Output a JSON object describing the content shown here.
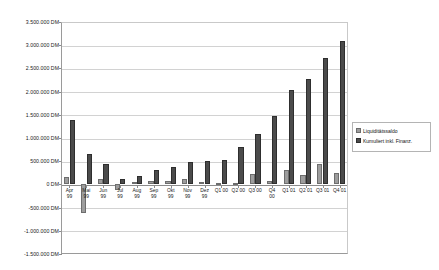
{
  "chart_data": {
    "type": "bar",
    "title": "",
    "xlabel": "",
    "ylabel": "",
    "ylim": [
      -1500000,
      3500000
    ],
    "ytick_step": 500000,
    "grid": true,
    "legend_position": "right",
    "unit": "DM",
    "ytick_labels": [
      "3.500.000 DM",
      "3.000.000 DM",
      "2.500.000 DM",
      "2.000.000 DM",
      "1.500.000 DM",
      "1.000.000 DM",
      "500.000 DM",
      "0 DM",
      "-500.000 DM",
      "-1.000.000 DM",
      "-1.500.000 DM"
    ],
    "ytick_values": [
      3500000,
      3000000,
      2500000,
      2000000,
      1500000,
      1000000,
      500000,
      0,
      -500000,
      -1000000,
      -1500000
    ],
    "categories": [
      "Apr 99",
      "Mai 99",
      "Jun 99",
      "Jul 99",
      "Aug 99",
      "Sep 99",
      "Okt 99",
      "Nov 99",
      "Dez 99",
      "Q1 00",
      "Q2 00",
      "Q3 00",
      "Q4 00",
      "Q1 01",
      "Q2 01",
      "Q3 01",
      "Q4 01"
    ],
    "category_lines": [
      [
        "Apr",
        "99"
      ],
      [
        "Mai",
        "99"
      ],
      [
        "Jun",
        "99"
      ],
      [
        "Jul",
        "99"
      ],
      [
        "Aug",
        "99"
      ],
      [
        "Sep",
        "99"
      ],
      [
        "Okt",
        "99"
      ],
      [
        "Nov",
        "99"
      ],
      [
        "Dez",
        "99"
      ],
      [
        "Q1 00",
        ""
      ],
      [
        "Q2 00",
        ""
      ],
      [
        "Q3 00",
        ""
      ],
      [
        "Q4",
        "00"
      ],
      [
        "Q1 01",
        ""
      ],
      [
        "Q2 01",
        ""
      ],
      [
        "Q3 01",
        ""
      ],
      [
        "Q4 01",
        ""
      ]
    ],
    "series": [
      {
        "name": "Liquiditätssaldo",
        "color": "#9d9d9d",
        "values": [
          150000,
          -620000,
          110000,
          -130000,
          60000,
          80000,
          70000,
          110000,
          60000,
          40000,
          20000,
          230000,
          80000,
          320000,
          200000,
          440000,
          240000
        ]
      },
      {
        "name": "Kumuliert inkl. Finanz.",
        "color": "#4b4b4b",
        "values": [
          1390000,
          650000,
          430000,
          120000,
          190000,
          300000,
          370000,
          480000,
          500000,
          520000,
          800000,
          1080000,
          1470000,
          2030000,
          2270000,
          2720000,
          3100000
        ]
      }
    ]
  },
  "legend": {
    "items": [
      {
        "label": "Liquiditätssaldo"
      },
      {
        "label": "Kumuliert inkl. Finanz."
      }
    ]
  }
}
